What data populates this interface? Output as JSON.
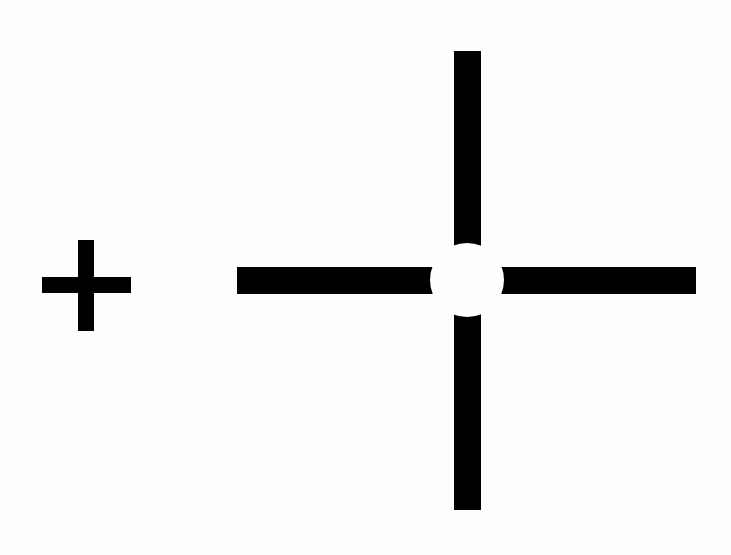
{
  "figure": {
    "colors": {
      "background": "#fefefe",
      "shape": "#000000"
    },
    "small_plus": {
      "horizontal": {
        "x": 42,
        "y": 277,
        "w": 89,
        "h": 16
      },
      "vertical": {
        "x": 78,
        "y": 240,
        "w": 16,
        "h": 91
      }
    },
    "large_cross": {
      "horizontal": {
        "x": 237,
        "y": 267,
        "w": 459,
        "h": 27
      },
      "vertical": {
        "x": 454,
        "y": 51,
        "w": 27,
        "h": 459
      },
      "center_gap": {
        "cx": 467,
        "cy": 280,
        "r": 37
      }
    }
  }
}
